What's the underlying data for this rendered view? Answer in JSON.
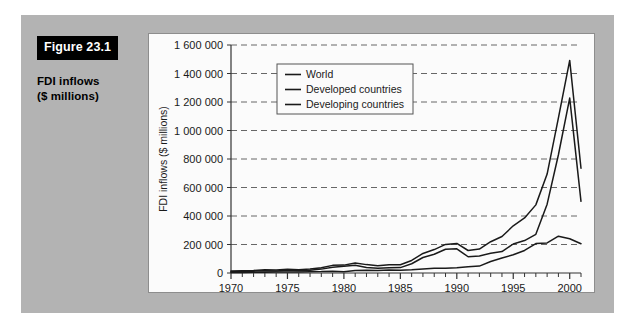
{
  "figure": {
    "tag": "Figure 23.1",
    "title_line1": "FDI inflows",
    "title_line2": "($ millions)",
    "panel_color": "#b3b3b3",
    "tag_bg_color": "#000000",
    "tag_text_color": "#ffffff",
    "card_bg_color": "#fbfbfb",
    "card_border_color": "#8d8d8d"
  },
  "chart_data": {
    "type": "line",
    "title": "",
    "xlabel": "",
    "ylabel": "FDI inflows ($ millions)",
    "xlim": [
      1970,
      2001
    ],
    "ylim": [
      0,
      1600000
    ],
    "ytick_step": 200000,
    "ytick_labels": [
      "0",
      "200 000",
      "400 000",
      "600 000",
      "800 000",
      "1 000 000",
      "1 200 000",
      "1 400 000",
      "1 600 000"
    ],
    "ytick_values": [
      0,
      200000,
      400000,
      600000,
      800000,
      1000000,
      1200000,
      1400000,
      1600000
    ],
    "xtick_labels": [
      "1970",
      "1975",
      "1980",
      "1985",
      "1990",
      "1995",
      "2000"
    ],
    "xtick_values": [
      1970,
      1975,
      1980,
      1985,
      1990,
      1995,
      2000
    ],
    "minor_xticks_every": 1,
    "grid": "horizontal-dashed",
    "legend_position": "upper-left-inside",
    "line_color": "#1a1a1a",
    "x": [
      1970,
      1971,
      1972,
      1973,
      1974,
      1975,
      1976,
      1977,
      1978,
      1979,
      1980,
      1981,
      1982,
      1983,
      1984,
      1985,
      1986,
      1987,
      1988,
      1989,
      1990,
      1991,
      1992,
      1993,
      1994,
      1995,
      1996,
      1997,
      1998,
      1999,
      2000,
      2001
    ],
    "series": [
      {
        "name": "World",
        "values": [
          13400,
          15600,
          17800,
          22100,
          20500,
          26700,
          22400,
          28500,
          37200,
          53600,
          55300,
          70600,
          58800,
          50500,
          58300,
          57600,
          87900,
          137200,
          164400,
          200500,
          207500,
          158000,
          168000,
          219400,
          255900,
          331100,
          386100,
          478100,
          694500,
          1088300,
          1491900,
          735100
        ]
      },
      {
        "name": "Developed countries",
        "values": [
          9500,
          11400,
          13100,
          16400,
          14000,
          19600,
          15600,
          19300,
          27200,
          40500,
          47100,
          53800,
          39300,
          33600,
          37000,
          38000,
          65100,
          108600,
          131500,
          167000,
          169800,
          114000,
          119700,
          138900,
          150600,
          203500,
          227700,
          271400,
          483200,
          829800,
          1227500,
          503100
        ]
      },
      {
        "name": "Developing countries",
        "values": [
          3900,
          4200,
          4700,
          5700,
          6500,
          7100,
          6800,
          9200,
          10000,
          13100,
          8200,
          16800,
          19500,
          16900,
          21300,
          19600,
          22800,
          28600,
          32900,
          33500,
          37700,
          44000,
          48300,
          80500,
          105400,
          127600,
          158400,
          206700,
          211300,
          258600,
          240200,
          205000
        ]
      }
    ]
  },
  "legend": {
    "items": [
      {
        "label": "World"
      },
      {
        "label": "Developed countries"
      },
      {
        "label": "Developing countries"
      }
    ]
  }
}
